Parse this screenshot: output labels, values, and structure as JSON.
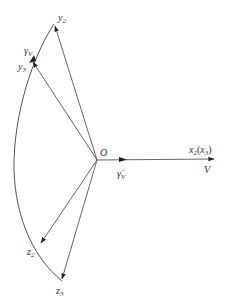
{
  "diagram": {
    "title": "",
    "origin": {
      "label": "O",
      "x": 97,
      "y": 160
    },
    "colors": {
      "line": "#555555",
      "text": "#333333",
      "arrow": "#222222"
    },
    "nodes": [
      {
        "id": "y2",
        "label": "y",
        "sub": "2",
        "x": 54,
        "y": 24
      },
      {
        "id": "y3",
        "label": "y",
        "sub": "3",
        "x": 32,
        "y": 61
      },
      {
        "id": "z2",
        "label": "z",
        "sub": "2",
        "x": 40,
        "y": 244
      },
      {
        "id": "z3",
        "label": "z",
        "sub": "3",
        "x": 62,
        "y": 281
      },
      {
        "id": "x2",
        "label": "x",
        "sub": "2",
        "x": 214,
        "y": 159
      }
    ],
    "edges": [
      {
        "from": "O",
        "to": "y2",
        "arrow": true
      },
      {
        "from": "O",
        "to": "y3",
        "arrow": true
      },
      {
        "from": "O",
        "to": "z2",
        "arrow": true
      },
      {
        "from": "O",
        "to": "z3",
        "arrow": true
      },
      {
        "from": "O",
        "to": "x2",
        "arrow": true
      }
    ],
    "arcs": [
      {
        "description": "rotation arc from y2 through y3, z2 to z3",
        "arrow_at": "y3",
        "label": "γV"
      }
    ],
    "labels": {
      "origin": "O",
      "y2": {
        "main": "y",
        "sub": "2"
      },
      "y3": {
        "main": "y",
        "sub": "3"
      },
      "gammaV": {
        "main": "γ",
        "sub": "V"
      },
      "z2": {
        "main": "z",
        "sub": "2"
      },
      "z3": {
        "main": "z",
        "sub": "3"
      },
      "x_axis": {
        "main": "x",
        "sub": "2",
        "paren_main": "x",
        "paren_sub": "3"
      },
      "velocity": "V",
      "gammaV_dot": {
        "main": "γ̇",
        "sub": "V"
      }
    }
  }
}
